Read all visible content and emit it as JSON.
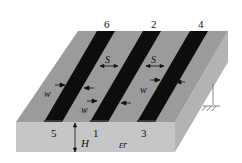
{
  "diagram": {
    "type": "coupled microstrip lines cross-section (3D)",
    "port_labels_top": [
      "6",
      "2",
      "4"
    ],
    "port_labels_front": [
      "5",
      "1",
      "3"
    ],
    "dimension_labels": {
      "spacing": "S",
      "width": "w",
      "height": "H",
      "permittivity": "εr"
    },
    "ground_symbol": "ground-icon",
    "colors": {
      "substrate_top": "#9a9a9a",
      "substrate_front": "#c4c4c4",
      "substrate_side": "#b2b2b2",
      "strip": "#0d0d0d",
      "background": "#ffffff"
    }
  }
}
